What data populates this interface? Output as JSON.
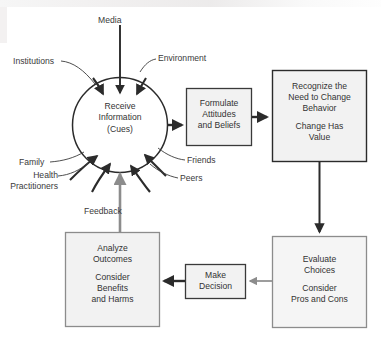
{
  "diagram": {
    "hub": {
      "name": "receive-information-cues",
      "line1": "Receive",
      "line2": "Information",
      "line3": "(Cues)"
    },
    "inputs_top": [
      {
        "id": "institutions",
        "label": "Institutions"
      },
      {
        "id": "media",
        "label": "Media"
      },
      {
        "id": "environment",
        "label": "Environment"
      }
    ],
    "inputs_bottom": [
      {
        "id": "family",
        "label": "Family"
      },
      {
        "id": "health-practitioners",
        "label_line1": "Health",
        "label_line2": "Practitioners"
      },
      {
        "id": "friends",
        "label": "Friends"
      },
      {
        "id": "peers",
        "label": "Peers"
      }
    ],
    "feedback": {
      "id": "feedback",
      "label": "Feedback"
    },
    "boxes": [
      {
        "id": "formulate-attitudes-and-beliefs",
        "line1": "Formulate",
        "line2": "Attitudes",
        "line3": "and Beliefs"
      },
      {
        "id": "recognize-need-to-change-behavior",
        "line1": "Recognize the",
        "line2": "Need to Change",
        "line3": "Behavior",
        "line4": "Change Has",
        "line5": "Value"
      },
      {
        "id": "evaluate-choices",
        "line1": "Evaluate",
        "line2": "Choices",
        "line3": "Consider",
        "line4": "Pros and Cons"
      },
      {
        "id": "make-decision",
        "line1": "Make",
        "line2": "Decision"
      },
      {
        "id": "analyze-outcomes",
        "line1": "Analyze",
        "line2": "Outcomes",
        "line3": "Consider",
        "line4": "Benefits",
        "line5": "and Harms"
      }
    ],
    "colors": {
      "stroke_dark": "#2b2b2b",
      "stroke_gray": "#8c8c8c",
      "box_fill": "#f2f2f2",
      "text": "#333333",
      "background": "#ffffff"
    },
    "caption_ghost": "............."
  }
}
